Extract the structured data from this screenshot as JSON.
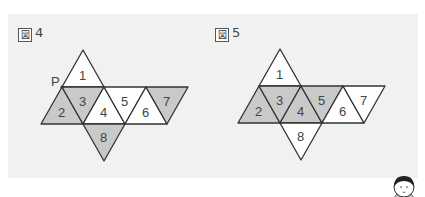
{
  "colors": {
    "panel_bg": "#f1f1f1",
    "shaded": "#c9c9c9",
    "unshaded": "#ffffff",
    "stroke": "#333333"
  },
  "figures": [
    {
      "label_char": "図",
      "label_num": "4",
      "vertex_label": "P",
      "faces": [
        {
          "n": "1",
          "shaded": false
        },
        {
          "n": "2",
          "shaded": true
        },
        {
          "n": "3",
          "shaded": true
        },
        {
          "n": "4",
          "shaded": false
        },
        {
          "n": "5",
          "shaded": false
        },
        {
          "n": "6",
          "shaded": false
        },
        {
          "n": "7",
          "shaded": true
        },
        {
          "n": "8",
          "shaded": true
        }
      ]
    },
    {
      "label_char": "図",
      "label_num": "5",
      "faces": [
        {
          "n": "1",
          "shaded": false
        },
        {
          "n": "2",
          "shaded": true
        },
        {
          "n": "3",
          "shaded": true
        },
        {
          "n": "4",
          "shaded": true
        },
        {
          "n": "5",
          "shaded": true
        },
        {
          "n": "6",
          "shaded": false
        },
        {
          "n": "7",
          "shaded": false
        },
        {
          "n": "8",
          "shaded": false
        }
      ]
    }
  ],
  "character": {
    "icon": "child-face-icon"
  }
}
